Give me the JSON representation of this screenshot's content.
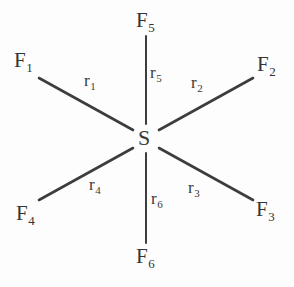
{
  "figure": {
    "name": "sulfur-hexafluoride-structure",
    "center_atom": "S",
    "line_color": "#3d3d3d",
    "text_color": "#333333",
    "background_color": "#fdfdfd"
  },
  "atoms": [
    {
      "key": "f1",
      "element": "F",
      "index": "1",
      "x": 14,
      "y": 50
    },
    {
      "key": "f2",
      "element": "F",
      "index": "2",
      "x": 257,
      "y": 54
    },
    {
      "key": "f3",
      "element": "F",
      "index": "3",
      "x": 256,
      "y": 199
    },
    {
      "key": "f4",
      "element": "F",
      "index": "4",
      "x": 16,
      "y": 203
    },
    {
      "key": "f5",
      "element": "F",
      "index": "5",
      "x": 136,
      "y": 10
    },
    {
      "key": "f6",
      "element": "F",
      "index": "6",
      "x": 136,
      "y": 246
    }
  ],
  "bonds": [
    {
      "key": "r1",
      "symbol": "r",
      "index": "1",
      "label_x": 84,
      "label_y": 72,
      "x1": 39,
      "y1": 78,
      "x2": 133,
      "y2": 130
    },
    {
      "key": "r2",
      "symbol": "r",
      "index": "2",
      "label_x": 191,
      "label_y": 74,
      "x1": 159,
      "y1": 130,
      "x2": 253,
      "y2": 78
    },
    {
      "key": "r3",
      "symbol": "r",
      "index": "3",
      "label_x": 188,
      "label_y": 179,
      "x1": 159,
      "y1": 148,
      "x2": 253,
      "y2": 200
    },
    {
      "key": "r4",
      "symbol": "r",
      "index": "4",
      "label_x": 89,
      "label_y": 176,
      "x1": 39,
      "y1": 200,
      "x2": 133,
      "y2": 148
    },
    {
      "key": "r5",
      "symbol": "r",
      "index": "5",
      "label_x": 150,
      "label_y": 64,
      "x1": 146,
      "y1": 36,
      "x2": 146,
      "y2": 124
    },
    {
      "key": "r6",
      "symbol": "r",
      "index": "6",
      "label_x": 151,
      "label_y": 190,
      "x1": 146,
      "y1": 153,
      "x2": 146,
      "y2": 243
    }
  ],
  "center": {
    "label": "S",
    "x": 138,
    "y": 127
  }
}
